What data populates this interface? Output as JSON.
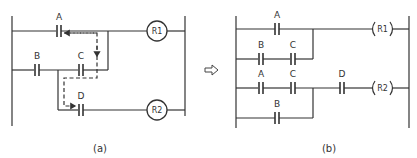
{
  "diagram": {
    "type": "ladder-logic",
    "transform_arrow": "⇨",
    "panel_a": {
      "caption": "(a)",
      "coils": {
        "r1": "R1",
        "r2": "R2"
      },
      "contacts": {
        "a": "A",
        "b": "B",
        "c": "C",
        "d": "D"
      },
      "sneak_path_note": "dashed arrow path A → C → D"
    },
    "panel_b": {
      "caption": "(b)",
      "coils": {
        "r1": "R1",
        "r2": "R2"
      },
      "rung1": {
        "branch1": [
          "A"
        ],
        "branch2": [
          "B",
          "C"
        ],
        "output": "R1"
      },
      "rung2": {
        "branch1": [
          "A",
          "C"
        ],
        "branch2": [
          "B"
        ],
        "series": [
          "D"
        ],
        "output": "R2"
      },
      "labels": {
        "a1": "A",
        "b1": "B",
        "c1": "C",
        "a2": "A",
        "c2": "C",
        "d": "D",
        "b2": "B"
      }
    }
  }
}
